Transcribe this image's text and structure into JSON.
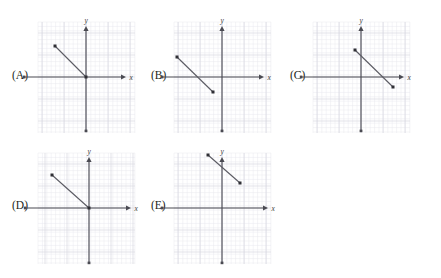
{
  "page": {
    "kind": "multiple-choice-graph-figure",
    "width": 441,
    "height": 278,
    "background": "#ffffff"
  },
  "style": {
    "axis_color": "#4a4a52",
    "line_color": "#5b5b63",
    "grid_minor_color": "#e9e9ef",
    "grid_major_color": "#d7d7e0",
    "label_color": "#231f20",
    "axis_letter_color": "#3b3b3b"
  },
  "axis_labels": {
    "x": "x",
    "y": "y"
  },
  "options": [
    {
      "id": "A",
      "label": "(A)",
      "label_pos": {
        "x": 12,
        "y": 70
      },
      "grid": {
        "x": 38,
        "y": 22,
        "w": 97,
        "h": 111,
        "minor": 4.4,
        "major": 22
      },
      "origin": {
        "x": 86,
        "y": 77
      },
      "x_axis": {
        "x1": 24,
        "x2": 126,
        "arrow": "right"
      },
      "y_axis": {
        "y1": 26,
        "y2": 131,
        "arrow": "up"
      },
      "segment": {
        "x1": 55,
        "y1": 46,
        "x2": 86,
        "y2": 77
      },
      "description": "segment from upper-left quadrant down to the origin"
    },
    {
      "id": "B",
      "label": "(B)",
      "label_pos": {
        "x": 151,
        "y": 70
      },
      "grid": {
        "x": 174,
        "y": 22,
        "w": 97,
        "h": 111,
        "minor": 4.4,
        "major": 22
      },
      "origin": {
        "x": 222,
        "y": 77
      },
      "x_axis": {
        "x1": 162,
        "x2": 264,
        "arrow": "right"
      },
      "y_axis": {
        "y1": 26,
        "y2": 131,
        "arrow": "up"
      },
      "segment": {
        "x1": 177,
        "y1": 57,
        "x2": 213,
        "y2": 92
      },
      "description": "segment in the left half crossing the x-axis, ending in the third quadrant"
    },
    {
      "id": "C",
      "label": "(C)",
      "label_pos": {
        "x": 290,
        "y": 70
      },
      "grid": {
        "x": 313,
        "y": 22,
        "w": 97,
        "h": 111,
        "minor": 4.4,
        "major": 22
      },
      "origin": {
        "x": 361,
        "y": 77
      },
      "x_axis": {
        "x1": 301,
        "x2": 404,
        "arrow": "right"
      },
      "y_axis": {
        "y1": 26,
        "y2": 131,
        "arrow": "up"
      },
      "segment": {
        "x1": 355,
        "y1": 50,
        "x2": 393,
        "y2": 87
      },
      "description": "segment crossing the y-axis above the origin and ending just below the x-axis on the right"
    },
    {
      "id": "D",
      "label": "(D)",
      "label_pos": {
        "x": 12,
        "y": 200
      },
      "grid": {
        "x": 38,
        "y": 153,
        "w": 97,
        "h": 111,
        "minor": 4.4,
        "major": 22
      },
      "origin": {
        "x": 89,
        "y": 208
      },
      "x_axis": {
        "x1": 25,
        "x2": 131,
        "arrow": "right"
      },
      "y_axis": {
        "y1": 157,
        "y2": 263,
        "arrow": "up"
      },
      "segment": {
        "x1": 52,
        "y1": 175,
        "x2": 89,
        "y2": 208
      },
      "description": "segment from the second quadrant down to the origin"
    },
    {
      "id": "E",
      "label": "(E)",
      "label_pos": {
        "x": 151,
        "y": 200
      },
      "grid": {
        "x": 174,
        "y": 153,
        "w": 97,
        "h": 111,
        "minor": 4.4,
        "major": 22
      },
      "origin": {
        "x": 222,
        "y": 208
      },
      "x_axis": {
        "x1": 162,
        "x2": 268,
        "arrow": "right"
      },
      "y_axis": {
        "y1": 157,
        "y2": 263,
        "arrow": "up"
      },
      "segment": {
        "x1": 208,
        "y1": 155,
        "x2": 240,
        "y2": 183
      },
      "description": "segment entirely above the x-axis crossing the y-axis"
    }
  ]
}
